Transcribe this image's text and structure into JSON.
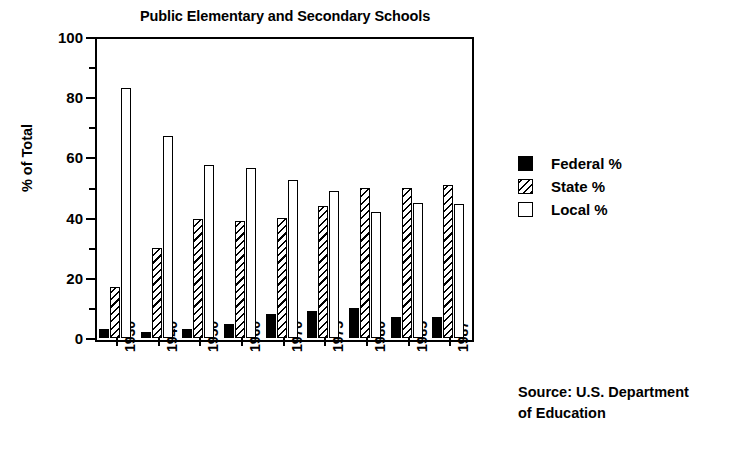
{
  "chart_data": {
    "type": "bar",
    "title": "Public Elementary and Secondary Schools",
    "xlabel": "",
    "ylabel": "% of Total",
    "ylim": [
      0,
      100
    ],
    "ytick_major": [
      0,
      20,
      40,
      60,
      80,
      100
    ],
    "ytick_minor": [
      10,
      30,
      50,
      70,
      90
    ],
    "ytick_labels": [
      "0",
      "20",
      "40",
      "60",
      "80",
      "100"
    ],
    "grid": false,
    "legend_position": "right",
    "categories": [
      "1930",
      "1940",
      "1950",
      "1960",
      "1970",
      "1975",
      "1980",
      "1985",
      "1987"
    ],
    "series": [
      {
        "name": "Federal %",
        "fill": "solid-black",
        "color": "#000000",
        "values": [
          3,
          2,
          3,
          4.5,
          8,
          9,
          10,
          7,
          7
        ]
      },
      {
        "name": "State %",
        "fill": "diagonal-hatch",
        "color": "#000000",
        "values": [
          17,
          30,
          39.5,
          39,
          40,
          44,
          50,
          50,
          51
        ]
      },
      {
        "name": "Local %",
        "fill": "white-outline",
        "color": "#ffffff",
        "values": [
          83,
          67,
          57.5,
          56.5,
          52.5,
          49,
          42,
          45,
          44.5
        ]
      }
    ],
    "annotations": [
      "Source: U.S. Department of Education"
    ]
  },
  "legend": {
    "items": [
      {
        "label": "Federal %",
        "style": "federal"
      },
      {
        "label": "State %",
        "style": "state"
      },
      {
        "label": "Local %",
        "style": "local"
      }
    ]
  },
  "source": {
    "line1": "Source: U.S. Department",
    "line2": "of Education"
  }
}
